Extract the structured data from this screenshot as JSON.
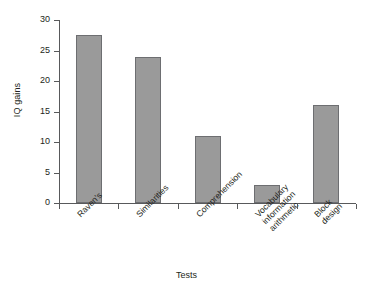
{
  "chart_data": {
    "type": "bar",
    "title": "",
    "xlabel": "Tests",
    "ylabel": "IQ gains",
    "categories": [
      "Raven's",
      "Similarities",
      "Comprehension",
      "Vocabulary information arithmetic",
      "Block design"
    ],
    "category_lines": [
      [
        "Raven's"
      ],
      [
        "Similarities"
      ],
      [
        "Comprehension"
      ],
      [
        "Vocabulary",
        "information",
        "arithmetic"
      ],
      [
        "Block",
        "design"
      ]
    ],
    "values": [
      27.5,
      24,
      11,
      3,
      16
    ],
    "ylim": [
      0,
      30
    ],
    "yticks": [
      0,
      5,
      10,
      15,
      20,
      25,
      30
    ],
    "ytick_labels": [
      "0",
      "5",
      "10",
      "15",
      "20",
      "25",
      "30"
    ],
    "grid": false,
    "legend": null,
    "bar_color": "#9a9a9a",
    "bar_border_color": "#6d6e71",
    "axis_color": "#58595b",
    "background": "#ffffff"
  }
}
